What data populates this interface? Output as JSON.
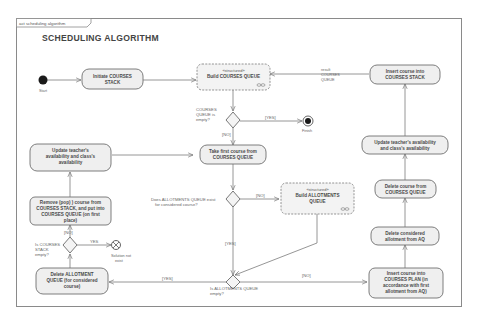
{
  "frame": {
    "tab_label": "act scheduling algorithm",
    "title": "SCHEDULING ALGORITHM"
  },
  "nodes": {
    "start": {
      "label": "Start"
    },
    "finish": {
      "label": "Finish"
    },
    "solution_not_exist": {
      "label_1": "Solution not",
      "label_2": "exist"
    },
    "init_stack": {
      "line1": "Initiate COURSES",
      "line2": "STACK"
    },
    "build_courses_queue": {
      "stereotype": "«structured»",
      "line1": "Build COURSES QUEUE"
    },
    "insert_into_stack": {
      "line1": "Insert course into",
      "line2": "COURSES STACK"
    },
    "update_right": {
      "line1": "Update teacher's availability",
      "line2": "and class's availability"
    },
    "take_first_course": {
      "line1": "Take first course from",
      "line2": "COURSES QUEUE"
    },
    "update_left": {
      "line1": "Update teacher's",
      "line2": "availability and class's",
      "line3": "availability"
    },
    "remove_pop": {
      "line1": "Remove (pop) ) course from",
      "line2": "COURSES STACK, and put into",
      "line3": "COURSES QUEUE (on first",
      "line4": "place)"
    },
    "build_allotments_queue": {
      "stereotype": "«structured»",
      "line1": "Build ALLOTMENTS",
      "line2": "QUEUE"
    },
    "delete_from_queue": {
      "line1": "Delete course from",
      "line2": "COURSES QUEUE"
    },
    "delete_allotment_aq": {
      "line1": "Delete considered",
      "line2": "allotment from AQ"
    },
    "insert_into_plan": {
      "line1": "Insert course into",
      "line2": "COURSES PLAN (in",
      "line3": "accordance with first",
      "line4": "allotment from AQ)"
    },
    "delete_allotment_queue": {
      "line1": "Delete ALLOTMENT",
      "line2": "QUEUE (for considered",
      "line3": "course)"
    }
  },
  "decisions": {
    "courses_queue_empty": {
      "line1": "COURSES",
      "line2": "QUEUE is",
      "line3": "empty?"
    },
    "allotments_queue_exists": {
      "line1": "Does ALLOTMENTS QUEUE exist",
      "line2": "for considered course?"
    },
    "courses_stack_empty": {
      "line1": "Is COURSES",
      "line2": "STACK",
      "line3": "empty?"
    },
    "allotments_queue_empty": {
      "line1": "Is ALLOTMENTS QUEUE",
      "line2": "empty?"
    }
  },
  "edges": {
    "result_label": {
      "line1": "result",
      "line2": "COURSES",
      "line3": "QUEUE"
    },
    "queue_empty_yes": "[YES]",
    "queue_empty_no": "[NO]",
    "aq_exists_no": "[NO]",
    "aq_exists_yes": "[YES]",
    "stack_empty_yes": "YES",
    "stack_empty_no": "[NO]",
    "aq_empty_yes": "[YES]",
    "aq_empty_no": "[NO]"
  },
  "colors": {
    "frame_stroke": "#8a8a8a",
    "node_fill": "#efefef",
    "node_stroke": "#6f6f6f",
    "text": "#4a4a4a"
  }
}
